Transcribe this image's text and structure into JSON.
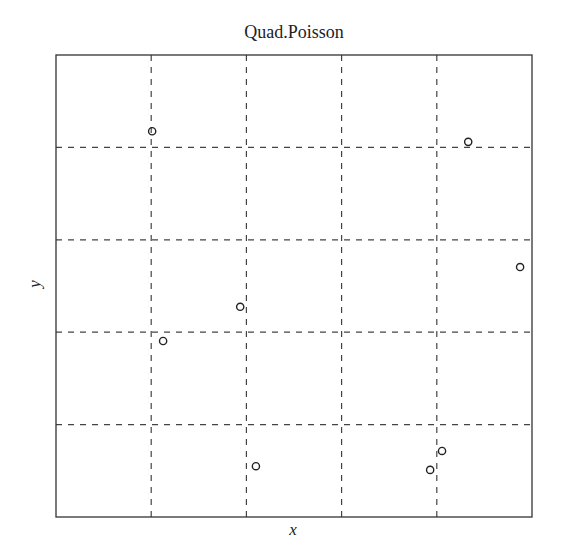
{
  "chart_data": {
    "type": "scatter",
    "title": "Quad.Poisson",
    "xlabel": "x",
    "ylabel": "y",
    "xlim": [
      0,
      1
    ],
    "ylim": [
      0,
      1
    ],
    "grid": {
      "style": "dashed",
      "quadrats": "5x5",
      "x_breaks": [
        0.2,
        0.4,
        0.6,
        0.8
      ],
      "y_breaks": [
        0.2,
        0.4,
        0.6,
        0.8
      ]
    },
    "marker": "open-circle",
    "points": [
      {
        "x": 0.202,
        "y": 0.835
      },
      {
        "x": 0.866,
        "y": 0.812
      },
      {
        "x": 0.975,
        "y": 0.541
      },
      {
        "x": 0.387,
        "y": 0.455
      },
      {
        "x": 0.225,
        "y": 0.381
      },
      {
        "x": 0.42,
        "y": 0.11
      },
      {
        "x": 0.811,
        "y": 0.143
      },
      {
        "x": 0.786,
        "y": 0.102
      }
    ],
    "legend": null,
    "tick_labels": "none"
  },
  "colors": {
    "frame": "#333333",
    "grid": "#444444",
    "marker": "#222222",
    "text": "#222222"
  }
}
